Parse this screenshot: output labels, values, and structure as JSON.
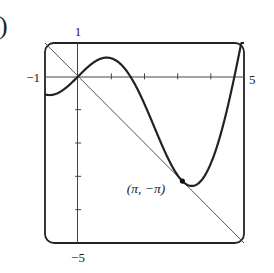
{
  "figure": {
    "part_marker": ")"
  },
  "chart_data": {
    "type": "line",
    "title": "",
    "xlabel": "",
    "ylabel": "",
    "xlim": [
      -1,
      5
    ],
    "ylim": [
      -5,
      1
    ],
    "grid": false,
    "x_tick_labels": [
      "-1",
      "5"
    ],
    "y_tick_labels": [
      "1",
      "-5"
    ],
    "x_ticks": [
      1,
      2,
      3,
      4
    ],
    "y_ticks": [
      -1,
      -2,
      -3,
      -4
    ],
    "series": [
      {
        "name": "y = x cos x",
        "function": "x*cos(x)",
        "stroke": "heavy"
      },
      {
        "name": "y = -x",
        "function": "-x",
        "stroke": "thin"
      }
    ],
    "annotations": [
      {
        "label": "(π, −π)",
        "x": 3.14159,
        "y": -3.14159,
        "marker": "dot"
      }
    ]
  },
  "labels": {
    "x_min": "−1",
    "x_max": "5",
    "y_max": "1",
    "y_min": "−5",
    "point": "(π, −π)"
  },
  "colors": {
    "ink": "#222222",
    "axis": "#444444",
    "line": "#555555"
  }
}
